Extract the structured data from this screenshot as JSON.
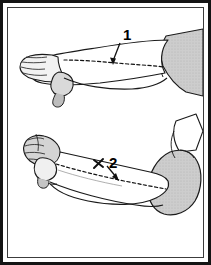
{
  "figure": {
    "background_color": "#ffffff",
    "outline_color": "#1a1a1a",
    "skin_fill_color": "#ffffff",
    "shaded_fill_color": "#c9c9c9",
    "dashed_line_color": "#111111",
    "border": {
      "outer_color": "#141414",
      "inner_color": "#3c3c3c",
      "outer_width_px": 3,
      "inner_width_px": 1
    },
    "panels": [
      {
        "name": "extended-forearm-panel",
        "position": "top",
        "description": "Forearm and hand shown extended, palm down, with dashed line along the forearm",
        "label": "1",
        "label_x": 123,
        "label_y": 36,
        "leader_from_x": 120,
        "leader_from_y": 42,
        "leader_to_x": 113,
        "leader_to_y": 64
      },
      {
        "name": "flexed-forearm-panel",
        "position": "bottom",
        "description": "Forearm bent at the elbow with closed fist, dashed line along the forearm",
        "label": "2",
        "label_x": 111,
        "label_y": 156,
        "leader_from_x": 108,
        "leader_from_y": 166,
        "leader_to_x": 118,
        "leader_to_y": 180,
        "marker": "x-mark",
        "marker_x": 98,
        "marker_y": 162
      }
    ],
    "callout_labels": [
      "1",
      "2"
    ]
  }
}
